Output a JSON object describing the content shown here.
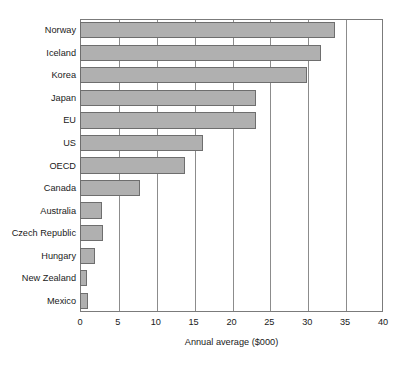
{
  "chart_data": {
    "type": "bar",
    "orientation": "horizontal",
    "title": "",
    "subtitle": "",
    "xlabel": "Annual average ($000)",
    "ylabel": "",
    "xlim": [
      0,
      40
    ],
    "xticks": [
      0,
      5,
      10,
      15,
      20,
      25,
      30,
      35,
      40
    ],
    "xtick_labels": [
      "0",
      "5",
      "10",
      "15",
      "20",
      "25",
      "30",
      "35",
      "40"
    ],
    "grid": true,
    "grid_axis": "x",
    "legend": false,
    "legend_position": "none",
    "categories": [
      "Norway",
      "Iceland",
      "Korea",
      "Japan",
      "EU",
      "US",
      "OECD",
      "Canada",
      "Australia",
      "Czech Republic",
      "Hungary",
      "New Zealand",
      "Mexico"
    ],
    "values": [
      33.6,
      31.8,
      30.0,
      23.2,
      23.2,
      16.2,
      13.8,
      7.9,
      2.9,
      3.0,
      2.0,
      0.9,
      1.0
    ],
    "series": [
      {
        "name": "Annual average ($000)",
        "values": [
          33.6,
          31.8,
          30.0,
          23.2,
          23.2,
          16.2,
          13.8,
          7.9,
          2.9,
          3.0,
          2.0,
          0.9,
          1.0
        ]
      }
    ]
  },
  "style": {
    "bar_fill": "#b0b0b0",
    "bar_stroke": "#6e6e6e",
    "grid_color": "#8c8c8c",
    "frame_color": "#7b7b7b",
    "text_color": "#1a1a1a",
    "background": "#ffffff"
  }
}
